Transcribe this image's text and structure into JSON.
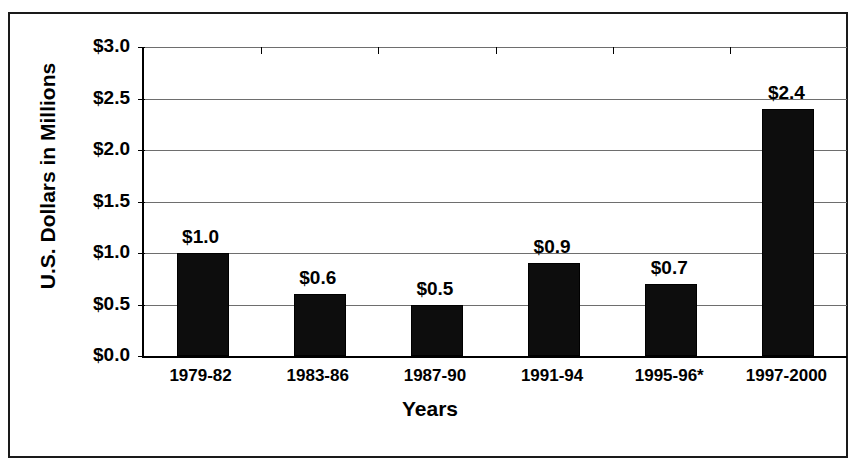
{
  "chart_data": {
    "type": "bar",
    "title": "",
    "xlabel": "Years",
    "ylabel": "U.S. Dollars in Millions",
    "categories": [
      "1979-82",
      "1983-86",
      "1987-90",
      "1991-94",
      "1995-96*",
      "1997-2000"
    ],
    "values": [
      1.0,
      0.6,
      0.5,
      0.9,
      0.7,
      2.4
    ],
    "value_labels": [
      "$1.0",
      "$0.6",
      "$0.5",
      "$0.9",
      "$0.7",
      "$2.4"
    ],
    "ylim": [
      0.0,
      3.0
    ],
    "ytick_values": [
      0.0,
      0.5,
      1.0,
      1.5,
      2.0,
      2.5,
      3.0
    ],
    "ytick_labels": [
      "$0.0",
      "$0.5",
      "$1.0",
      "$1.5",
      "$2.0",
      "$2.5",
      "$3.0"
    ],
    "grid": "horizontal",
    "legend": "none",
    "bar_color": "#0d0d0d",
    "gridline_color": "#6e6e6e",
    "axis_color": "#000000",
    "background_color": "#ffffff",
    "footnote_marker": "*"
  }
}
